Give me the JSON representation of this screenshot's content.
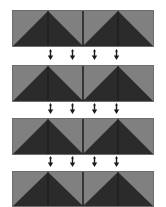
{
  "figure": {
    "background_color": "#ffffff",
    "width": 166,
    "height": 207
  },
  "palette": {
    "light_gray": "#808080",
    "mid_gray": "#7a7a7a",
    "dark": "#2b2b2b",
    "darker": "#232323",
    "dark_alt": "#303030",
    "outline": "#6d6d6d",
    "cell_divider": "#111111",
    "arrow_color": "#1a1a1a"
  },
  "bands": [
    {
      "id": "band-1",
      "label": "Pattern Row 1",
      "top": 10,
      "height": 37,
      "cells": [
        {
          "name": "cell-1-1",
          "shape": "diagonal-split",
          "orientation": "rise-right",
          "light": "#808080",
          "dark": "#2b2b2b"
        },
        {
          "name": "cell-1-2",
          "shape": "diagonal-split",
          "orientation": "fall-right",
          "light": "#808080",
          "dark": "#2b2b2b"
        },
        {
          "name": "cell-1-3",
          "shape": "diagonal-split",
          "orientation": "rise-right",
          "light": "#808080",
          "dark": "#2b2b2b"
        },
        {
          "name": "cell-1-4",
          "shape": "diagonal-split",
          "orientation": "fall-right",
          "light": "#808080",
          "dark": "#2b2b2b"
        }
      ]
    },
    {
      "id": "band-2",
      "label": "Pattern Row 2",
      "top": 65,
      "height": 37,
      "cells": [
        {
          "name": "cell-2-1",
          "shape": "diagonal-split",
          "orientation": "rise-right",
          "light": "#808080",
          "dark": "#2b2b2b"
        },
        {
          "name": "cell-2-2",
          "shape": "diagonal-split",
          "orientation": "fall-right",
          "light": "#808080",
          "dark": "#2b2b2b"
        },
        {
          "name": "cell-2-3",
          "shape": "diagonal-split",
          "orientation": "rise-right",
          "light": "#808080",
          "dark": "#2b2b2b"
        },
        {
          "name": "cell-2-4",
          "shape": "diagonal-split",
          "orientation": "fall-right",
          "light": "#808080",
          "dark": "#2b2b2b"
        }
      ]
    },
    {
      "id": "band-3",
      "label": "Pattern Row 3",
      "top": 118,
      "height": 37,
      "cells": [
        {
          "name": "cell-3-1",
          "shape": "diagonal-split",
          "orientation": "rise-right",
          "light": "#808080",
          "dark": "#2b2b2b"
        },
        {
          "name": "cell-3-2",
          "shape": "diagonal-split",
          "orientation": "fall-right",
          "light": "#808080",
          "dark": "#2b2b2b"
        },
        {
          "name": "cell-3-3",
          "shape": "diagonal-split",
          "orientation": "rise-right",
          "light": "#808080",
          "dark": "#2b2b2b"
        },
        {
          "name": "cell-3-4",
          "shape": "diagonal-split",
          "orientation": "fall-right",
          "light": "#808080",
          "dark": "#2b2b2b"
        }
      ]
    },
    {
      "id": "band-4",
      "label": "Pattern Row 4",
      "top": 171,
      "height": 36,
      "cells": [
        {
          "name": "cell-4-1",
          "shape": "diagonal-split",
          "orientation": "rise-right",
          "light": "#808080",
          "dark": "#2b2b2b"
        },
        {
          "name": "cell-4-2",
          "shape": "diagonal-split",
          "orientation": "fall-right",
          "light": "#808080",
          "dark": "#2b2b2b"
        },
        {
          "name": "cell-4-3",
          "shape": "diagonal-split",
          "orientation": "rise-right",
          "light": "#808080",
          "dark": "#2b2b2b"
        },
        {
          "name": "cell-4-4",
          "shape": "diagonal-split",
          "orientation": "fall-right",
          "light": "#808080",
          "dark": "#2b2b2b"
        }
      ]
    }
  ],
  "arrow_rows": [
    {
      "id": "arrow-row-1",
      "label": "Transition 1",
      "top": 49,
      "direction": "down",
      "count": 4,
      "icons": [
        "arrow-down-icon",
        "arrow-down-icon",
        "arrow-down-icon",
        "arrow-down-icon"
      ]
    },
    {
      "id": "arrow-row-2",
      "label": "Transition 2",
      "top": 103,
      "direction": "down",
      "count": 4,
      "icons": [
        "arrow-down-icon",
        "arrow-down-icon",
        "arrow-down-icon",
        "arrow-down-icon"
      ]
    },
    {
      "id": "arrow-row-3",
      "label": "Transition 3",
      "top": 156,
      "direction": "down",
      "count": 4,
      "icons": [
        "arrow-down-icon",
        "arrow-down-icon",
        "arrow-down-icon",
        "arrow-down-icon"
      ]
    }
  ]
}
